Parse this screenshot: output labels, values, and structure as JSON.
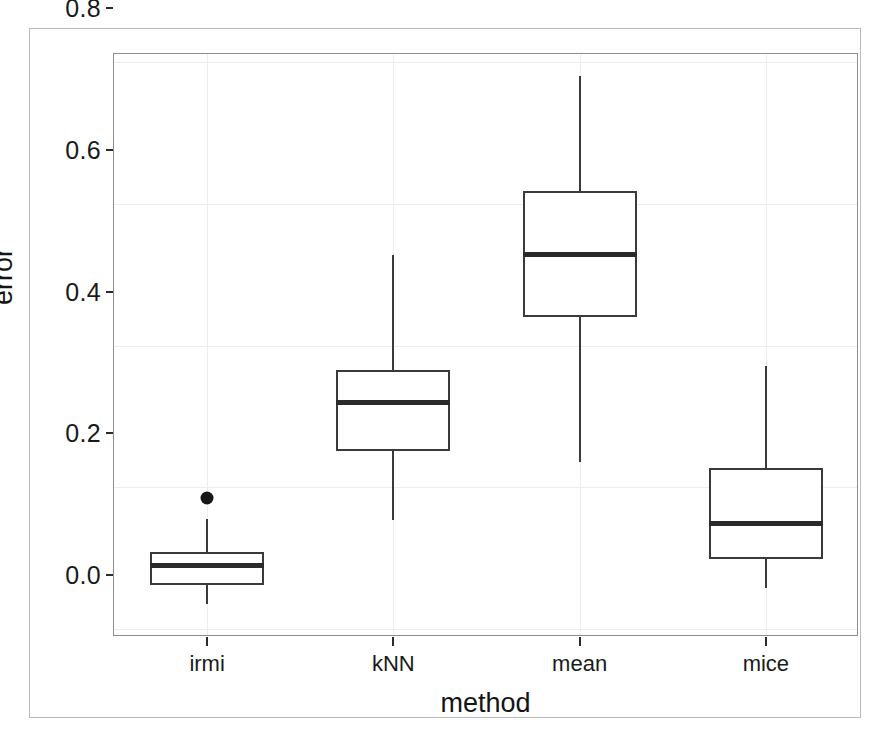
{
  "chart_data": {
    "type": "box",
    "title": "",
    "xlabel": "method",
    "ylabel": "error",
    "categories": [
      "irmi",
      "kNN",
      "mean",
      "mice"
    ],
    "ylim": [
      -0.012,
      0.812
    ],
    "yticks": [
      0.0,
      0.2,
      0.4,
      0.6,
      0.8
    ],
    "ytick_labels": [
      "0.0",
      "0.2",
      "0.4",
      "0.6",
      "0.8"
    ],
    "grid": true,
    "legend": null,
    "boxes": [
      {
        "category": "irmi",
        "whisker_low": 0.034,
        "q1": 0.062,
        "median": 0.089,
        "q3": 0.108,
        "whisker_high": 0.155,
        "outliers": [
          0.185
        ]
      },
      {
        "category": "kNN",
        "whisker_low": 0.154,
        "q1": 0.251,
        "median": 0.319,
        "q3": 0.365,
        "whisker_high": 0.528,
        "outliers": []
      },
      {
        "category": "mean",
        "whisker_low": 0.236,
        "q1": 0.44,
        "median": 0.529,
        "q3": 0.619,
        "whisker_high": 0.781,
        "outliers": []
      },
      {
        "category": "mice",
        "whisker_low": 0.057,
        "q1": 0.098,
        "median": 0.149,
        "q3": 0.227,
        "whisker_high": 0.371,
        "outliers": []
      }
    ]
  },
  "style": {
    "box_line_color": "#3a3a3a",
    "median_color": "#2a2a2a",
    "grid_color": "#ededed",
    "panel_border_color": "#8d8d8d",
    "outlier_color": "#171717",
    "background": "#ffffff"
  }
}
